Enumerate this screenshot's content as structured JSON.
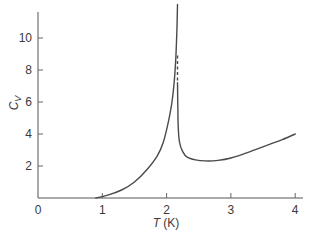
{
  "chart_data": {
    "type": "line",
    "title": "",
    "xlabel": "T (K)",
    "xlabel_italic": "T",
    "xlabel_unit": " (K)",
    "ylabel": "C_V",
    "ylabel_main": "C",
    "ylabel_sub": "V",
    "xlim": [
      0,
      4.05
    ],
    "ylim": [
      0,
      11.6
    ],
    "x_ticks": [
      0,
      1,
      2,
      3,
      4
    ],
    "x_tick_labels": [
      "0",
      "1",
      "2",
      "3",
      "4"
    ],
    "y_ticks": [
      2,
      4,
      6,
      8,
      10
    ],
    "y_tick_labels": [
      "2",
      "4",
      "6",
      "8",
      "10"
    ],
    "grid": false,
    "legend": null,
    "series": [
      {
        "name": "below lambda point",
        "style": "solid",
        "points": [
          [
            0.9,
            0.0
          ],
          [
            1.1,
            0.2
          ],
          [
            1.3,
            0.5
          ],
          [
            1.5,
            1.0
          ],
          [
            1.7,
            1.8
          ],
          [
            1.85,
            2.6
          ],
          [
            1.95,
            3.5
          ],
          [
            2.05,
            5.2
          ],
          [
            2.1,
            6.5
          ],
          [
            2.14,
            8.5
          ],
          [
            2.16,
            10.5
          ],
          [
            2.17,
            12.1
          ]
        ]
      },
      {
        "name": "lambda discontinuity",
        "style": "dashed",
        "points": [
          [
            2.17,
            8.9
          ],
          [
            2.17,
            7.2
          ]
        ]
      },
      {
        "name": "above lambda point",
        "style": "solid",
        "points": [
          [
            2.17,
            7.2
          ],
          [
            2.175,
            5.5
          ],
          [
            2.18,
            4.5
          ],
          [
            2.2,
            3.5
          ],
          [
            2.25,
            2.9
          ],
          [
            2.32,
            2.55
          ],
          [
            2.45,
            2.38
          ],
          [
            2.6,
            2.32
          ],
          [
            2.8,
            2.35
          ],
          [
            3.0,
            2.5
          ],
          [
            3.3,
            2.9
          ],
          [
            3.6,
            3.35
          ],
          [
            3.8,
            3.65
          ],
          [
            4.0,
            4.0
          ]
        ]
      }
    ],
    "annotations": []
  }
}
